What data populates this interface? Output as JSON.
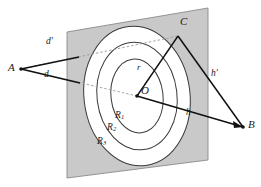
{
  "figure": {
    "type": "geometry-diagram",
    "colors": {
      "plane_fill": "#c9c9c9",
      "plane_stroke": "#8a8a8a",
      "ring_fill": "#ffffff",
      "ring_stroke": "#3a3a3a",
      "line": "#111111",
      "dashed": "#9a9a9a",
      "background": "#ffffff"
    },
    "points": [
      {
        "id": "A",
        "label": "A",
        "x": 21,
        "y": 69,
        "label_x": 8,
        "label_y": 62,
        "dot": true
      },
      {
        "id": "B",
        "label": "B",
        "x": 243,
        "y": 127,
        "label_x": 248,
        "label_y": 125,
        "dot": true
      },
      {
        "id": "C",
        "label": "C",
        "x": 178,
        "y": 36,
        "label_x": 180,
        "label_y": 22,
        "dot": false
      },
      {
        "id": "O",
        "label": "O",
        "x": 137,
        "y": 96,
        "label_x": 141,
        "label_y": 85,
        "dot": true
      }
    ],
    "segments": [
      {
        "id": "d-prime",
        "label": "d'",
        "from": "A",
        "to": "C",
        "style": "dashed",
        "label_x": 46,
        "label_y": 42
      },
      {
        "id": "d",
        "label": "d",
        "from": "A",
        "to": "O",
        "style": "dashed",
        "label_x": 44,
        "label_y": 74
      },
      {
        "id": "h-prime",
        "label": "h'",
        "from": "C",
        "to": "B",
        "style": "solid",
        "label_x": 211,
        "label_y": 74
      },
      {
        "id": "h",
        "label": "h",
        "from": "O",
        "to": "B",
        "style": "solid",
        "label_x": 186,
        "label_y": 113
      },
      {
        "id": "r",
        "label": "r",
        "from": "O",
        "to": "C",
        "style": "solid",
        "label_x": 137,
        "label_y": 67
      }
    ],
    "rings": [
      {
        "id": "R1",
        "label": "R",
        "subscript": "1",
        "rx": 26,
        "ry": 37,
        "label_x": 115,
        "label_y": 116
      },
      {
        "id": "R2",
        "label": "R",
        "subscript": "2",
        "rx": 40,
        "ry": 54,
        "label_x": 107,
        "label_y": 128
      },
      {
        "id": "R3",
        "label": "R",
        "subscript": "3",
        "rx": 53,
        "ry": 70,
        "label_x": 97,
        "label_y": 142
      }
    ],
    "plane": {
      "id": "plane",
      "corners": [
        [
          67,
          32
        ],
        [
          208,
          8
        ],
        [
          208,
          160
        ],
        [
          67,
          178
        ]
      ]
    }
  }
}
